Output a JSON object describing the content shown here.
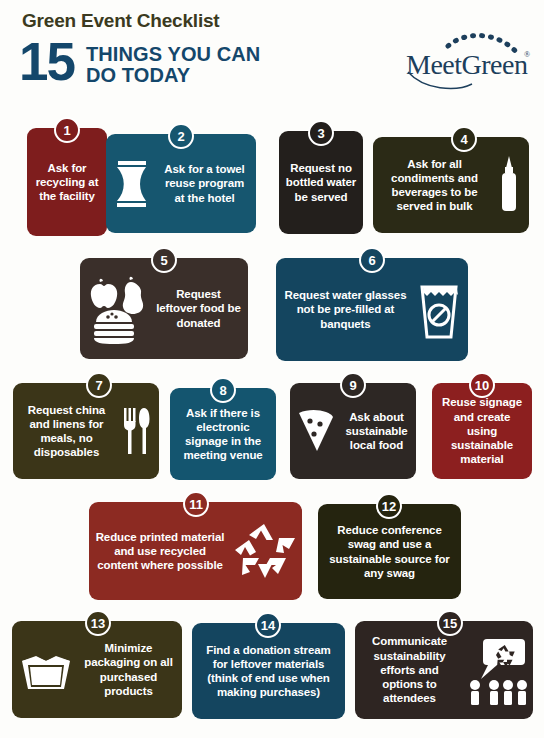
{
  "header": {
    "kicker": "Green Event Checklist",
    "big_number": "15",
    "headline_line1": "THINGS YOU CAN",
    "headline_line2": "DO TODAY",
    "kicker_color": "#3b3a20",
    "accent_color": "#14476b"
  },
  "logo": {
    "name": "MeetGreen",
    "word": "MeetGreen",
    "registered_mark": "®",
    "color": "#1d3f5c",
    "arc_icon": "dashed-arc-icon"
  },
  "palette": {
    "dark_red": "#7e1d1d",
    "brick_red": "#8c2a22",
    "teal": "#16566f",
    "navy": "#14455f",
    "near_black": "#231f1c",
    "dark_brown": "#3a2f2a",
    "olive": "#3b3518",
    "dark_olive": "#2b2a16",
    "background": "#fdfdfb",
    "text": "#ffffff"
  },
  "items": [
    {
      "number": "1",
      "text": "Ask for recycling at the facility",
      "color": "#7e1d1d",
      "icon": null,
      "icon_side": null
    },
    {
      "number": "2",
      "text": "Ask for a towel reuse program at the hotel",
      "color": "#16566f",
      "icon": "folded-towel-icon",
      "icon_side": "left"
    },
    {
      "number": "3",
      "text": "Request no bottled water be served",
      "color": "#231f1c",
      "icon": null,
      "icon_side": null
    },
    {
      "number": "4",
      "text": "Ask for all condiments and beverages to be served in bulk",
      "color": "#2b2a16",
      "icon": "condiment-bottle-icon",
      "icon_side": "right"
    },
    {
      "number": "5",
      "text": "Request leftover food be donated",
      "color": "#3a2f2a",
      "icon": "apple-pear-burger-icon",
      "icon_side": "left"
    },
    {
      "number": "6",
      "text": "Request water glasses not be pre-filled at banquets",
      "color": "#14455f",
      "icon": "no-prefilled-glass-icon",
      "icon_side": "right"
    },
    {
      "number": "7",
      "text": "Request china and linens for meals, no disposables",
      "color": "#3b3518",
      "icon": "fork-knife-icon",
      "icon_side": "right"
    },
    {
      "number": "8",
      "text": "Ask if there is electronic signage in the meeting venue",
      "color": "#14556f",
      "icon": null,
      "icon_side": null
    },
    {
      "number": "9",
      "text": "Ask about sustainable local food",
      "color": "#2d2724",
      "icon": "pizza-slice-icon",
      "icon_side": "left"
    },
    {
      "number": "10",
      "text": "Reuse signage and create using sustainable material",
      "color": "#8c1f1f",
      "icon": null,
      "icon_side": null
    },
    {
      "number": "11",
      "text": "Reduce printed material and use recycled content where possible",
      "color": "#8c2a22",
      "icon": "recycle-icon",
      "icon_side": "right"
    },
    {
      "number": "12",
      "text": "Reduce conference swag and use a sustainable source for any swag",
      "color": "#25240f",
      "icon": null,
      "icon_side": null
    },
    {
      "number": "13",
      "text": "Minimize packaging on all purchased products",
      "color": "#3b3518",
      "icon": "open-box-icon",
      "icon_side": "left"
    },
    {
      "number": "14",
      "text": "Find a donation stream for leftover materials (think of end use when making purchases)",
      "color": "#14455f",
      "icon": null,
      "icon_side": null
    },
    {
      "number": "15",
      "text": "Communicate sustainability efforts and options to attendees",
      "color": "#2e2522",
      "icon": "attendees-speech-recycle-icon",
      "icon_side": "right"
    }
  ]
}
